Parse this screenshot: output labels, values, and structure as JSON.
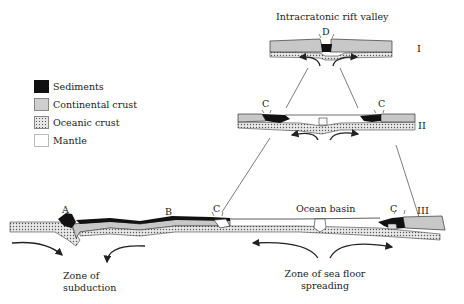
{
  "legend": {
    "items": [
      {
        "key": "sediments",
        "label": "Sediments"
      },
      {
        "key": "continental",
        "label": "Continental crust"
      },
      {
        "key": "oceanic",
        "label": "Oceanic crust"
      },
      {
        "key": "mantle",
        "label": "Mantle"
      }
    ]
  },
  "stages": {
    "I": {
      "numeral": "I",
      "title": "Intracratonic rift valley",
      "marker": "D"
    },
    "II": {
      "numeral": "II",
      "marker_left": "C",
      "marker_right": "C"
    },
    "III": {
      "numeral": "III",
      "marker_a": "A",
      "marker_b": "B",
      "marker_c_left": "C",
      "marker_c_right": "C",
      "center_label": "Ocean basin"
    }
  },
  "annotations": {
    "subduction_line1": "Zone of",
    "subduction_line2": "subduction",
    "spreading_line1": "Zone of sea floor",
    "spreading_line2": "spreading"
  },
  "colors": {
    "sediment": "#111111",
    "continental": "#cfcfcf",
    "oceanic_bg": "#e6e6e6",
    "outline": "#333333"
  }
}
